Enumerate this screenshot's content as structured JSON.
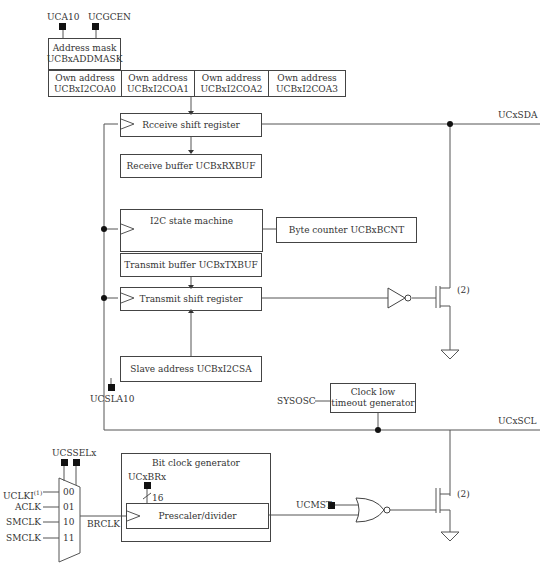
{
  "diagram": {
    "top_controls": {
      "uca10": "UCA10",
      "ucgcen": "UCGCEN"
    },
    "address_mask": {
      "line1": "Address mask",
      "line2": "UCBxADDMASK"
    },
    "own_addresses": [
      {
        "line1": "Own address",
        "line2": "UCBxI2COA0"
      },
      {
        "line1": "Own address",
        "line2": "UCBxI2COA1"
      },
      {
        "line1": "Own address",
        "line2": "UCBxI2COA2"
      },
      {
        "line1": "Own address",
        "line2": "UCBxI2COA3"
      }
    ],
    "blocks": {
      "receive_shift": "Rcceive shift register",
      "receive_buffer": "Receive buffer UCBxRXBUF",
      "state_machine": "I2C state machine",
      "byte_counter": "Byte counter UCBxBCNT",
      "transmit_buffer": "Transmit buffer UCBxTXBUF",
      "transmit_shift": "Transmit shift register",
      "slave_address": "Slave address UCBxI2CSA",
      "clock_low_line1": "Clock low",
      "clock_low_line2": "timeout generator",
      "bit_clock_title": "Bit clock generator",
      "prescaler": "Prescaler/divider"
    },
    "signals": {
      "ucxsda": "UCxSDA",
      "ucxscl": "UCxSCL",
      "ucsla10": "UCSLA10",
      "sysosc": "SYSOSC",
      "ucsselx": "UCSSELx",
      "ucxbrx": "UCxBRx",
      "bus_width": "16",
      "brclk": "BRCLK",
      "ucmst": "UCMST",
      "note_sda": "(2)",
      "note_scl": "(2)"
    },
    "mux_inputs": [
      {
        "name": "UCLKI",
        "sup": "(1)",
        "sel": "00"
      },
      {
        "name": "ACLK",
        "sup": "",
        "sel": "01"
      },
      {
        "name": "SMCLK",
        "sup": "",
        "sel": "10"
      },
      {
        "name": "SMCLK",
        "sup": "",
        "sel": "11"
      }
    ]
  }
}
